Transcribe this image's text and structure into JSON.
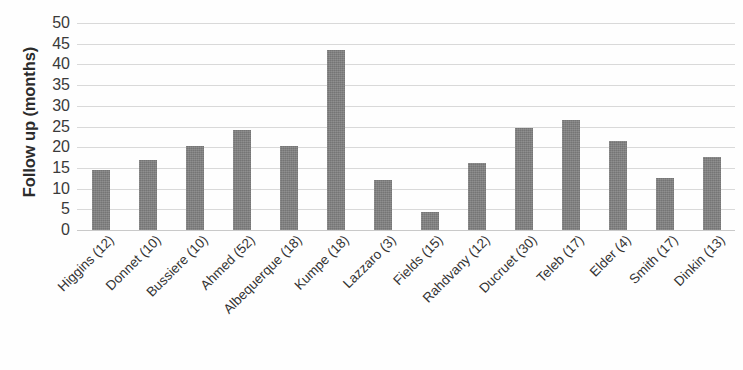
{
  "chart_data": {
    "type": "bar",
    "title": "",
    "xlabel": "",
    "ylabel": "Follow up (months)",
    "ylim": [
      0,
      50
    ],
    "ytick_step": 5,
    "yticks": [
      50,
      45,
      40,
      35,
      30,
      25,
      20,
      15,
      10,
      5,
      0
    ],
    "grid": true,
    "legend": "none",
    "bar_color": "#808080",
    "gridline_color": "#d9d9d9",
    "categories": [
      "Higgins (12)",
      "Donnet (10)",
      "Bussiere (10)",
      "Ahmed (52)",
      "Albequerque (18)",
      "Kumpe (18)",
      "Lazzaro (3)",
      "Fields (15)",
      "Rahdvany (12)",
      "Ducruet (30)",
      "Teleb (17)",
      "Elder (4)",
      "Smith (17)",
      "Dinkin (13)"
    ],
    "values": [
      14.5,
      17,
      20.3,
      24.2,
      20.3,
      43.5,
      12,
      4.3,
      16.2,
      24.6,
      26.6,
      21.5,
      12.6,
      17.6
    ]
  }
}
